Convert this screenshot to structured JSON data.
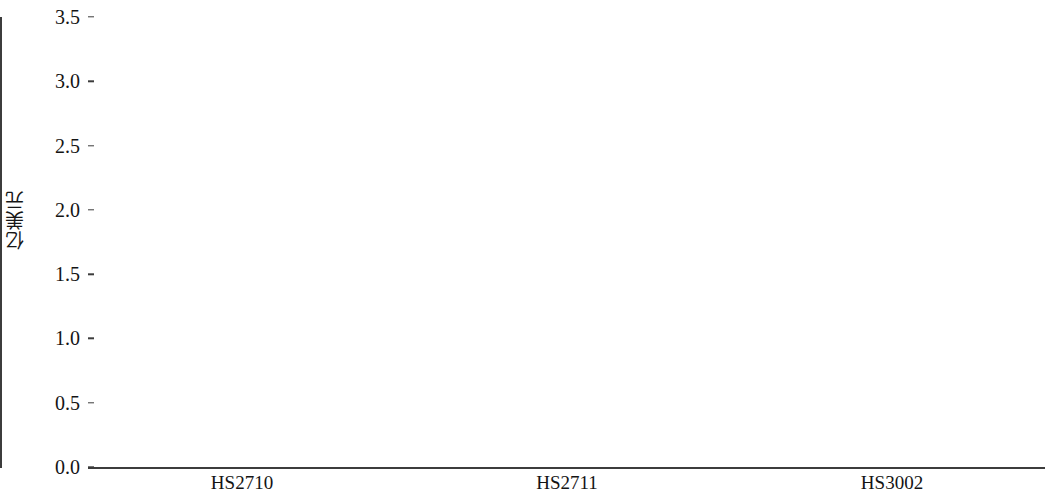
{
  "chart_data": {
    "type": "bar",
    "title": "",
    "subtitle": "",
    "xlabel": "",
    "ylabel": "亿美元",
    "ylim": [
      0.0,
      3.5
    ],
    "ytick_labels": [
      "0.0",
      "0.5",
      "1.0",
      "1.5",
      "2.0",
      "2.5",
      "3.0",
      "3.5"
    ],
    "ytick_values": [
      0.0,
      0.5,
      1.0,
      1.5,
      2.0,
      2.5,
      3.0,
      3.5
    ],
    "grid": false,
    "legend": null,
    "categories": [
      "HS2710",
      "HS2711",
      "HS3002"
    ],
    "bars_per_group": 5,
    "groups": [
      {
        "label": "HS2710",
        "color": "#2e2430",
        "values": [
          1.74,
          1.8,
          0.56,
          1.4,
          3.05
        ],
        "value_labels": [
          "1.74",
          "1.80",
          "0.56",
          "1.40",
          "3.05"
        ]
      },
      {
        "label": "HS2711",
        "color": "#3d8174",
        "values": [
          0.0,
          0.0,
          0.0,
          0.0,
          0.44
        ],
        "value_labels": [
          "0.00",
          "0.00",
          "0.00",
          "0.00",
          "0.44"
        ]
      },
      {
        "label": "HS3002",
        "color": "#f0de4c",
        "values": [
          0.14,
          0.21,
          0.25,
          0.04,
          0.24
        ],
        "value_labels": [
          "0.14",
          "0.21",
          "0.25",
          "0.04",
          "0.24"
        ]
      }
    ],
    "colors": {
      "group_1": "#2e2430",
      "group_2": "#3d8174",
      "group_3": "#f0de4c",
      "axis": "#3c3c3c",
      "text": "#141414",
      "background": "#ffffff"
    }
  }
}
